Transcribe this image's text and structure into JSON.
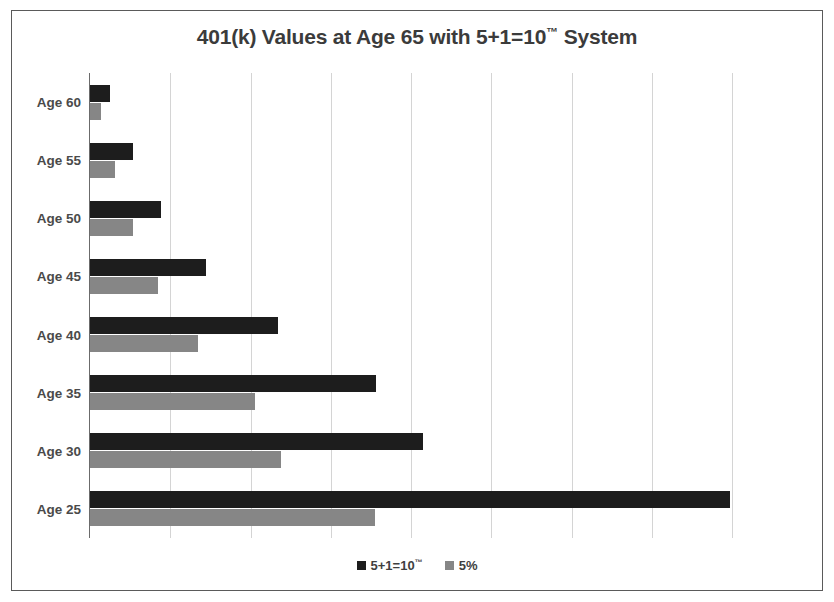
{
  "chart_data": {
    "type": "bar",
    "orientation": "horizontal",
    "title": "401(k) Values at Age 65 with 5+1=10™ System",
    "title_main": "401(k) Values at Age 65 with 5+1=10",
    "title_tm": "™",
    "title_tail": " System",
    "xlabel": "",
    "ylabel": "",
    "grid": true,
    "gridlines": 9,
    "axis_tick_labels_visible": false,
    "legend_position": "bottom",
    "categories": [
      "Age 60",
      "Age 55",
      "Age 50",
      "Age 45",
      "Age 40",
      "Age 35",
      "Age 30",
      "Age 25"
    ],
    "xlim": [
      0,
      8
    ],
    "series": [
      {
        "name": "5+1=10™",
        "name_main": "5+1=10",
        "name_tm": "™",
        "color": "#1d1d1d",
        "values": [
          0.25,
          0.54,
          0.89,
          1.44,
          2.34,
          3.56,
          4.15,
          7.98
        ]
      },
      {
        "name": "5%",
        "name_main": "5%",
        "name_tm": "",
        "color": "#868686",
        "values": [
          0.14,
          0.31,
          0.53,
          0.85,
          1.34,
          2.06,
          2.38,
          3.55
        ]
      }
    ]
  },
  "colors": {
    "series_dark": "#1d1d1d",
    "series_gray": "#868686",
    "gridline": "#d4d4d4",
    "axis": "#6b6b6b",
    "frame": "#5a5a5a",
    "text": "#3b3b3b",
    "background": "#ffffff"
  }
}
